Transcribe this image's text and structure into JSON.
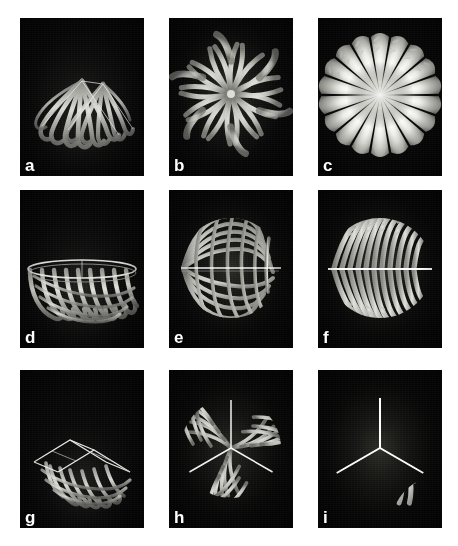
{
  "figure": {
    "background_color": "#ffffff",
    "panel_background_color": "#050505",
    "structure_color": "#d8d8d4",
    "label_color": "#ffffff",
    "grid": {
      "rows": 3,
      "columns": 3
    },
    "panels": [
      {
        "id": "a",
        "label": "a",
        "row": 1,
        "column": 1,
        "description": "fan-shaped ribbon bundle in oblique view, flattened shell",
        "structure": "oblique-fan",
        "ribbon_count": 14,
        "x": 20,
        "y": 18,
        "width": 124,
        "height": 158
      },
      {
        "id": "b",
        "label": "b",
        "row": 1,
        "column": 2,
        "description": "double counter-rotating spiral rosette seen from above",
        "structure": "spiral-rosette",
        "ribbon_count": 22,
        "x": 169,
        "y": 18,
        "width": 124,
        "height": 158
      },
      {
        "id": "c",
        "label": "c",
        "row": 1,
        "column": 3,
        "description": "bright radial burst with serrated blade tips",
        "structure": "radial-burst",
        "ribbon_count": 18,
        "x": 318,
        "y": 18,
        "width": 124,
        "height": 158
      },
      {
        "id": "d",
        "label": "d",
        "row": 2,
        "column": 1,
        "description": "bowl lattice with elliptical rim, oblique view",
        "structure": "oblique-bowl",
        "ribbon_count": 16,
        "x": 20,
        "y": 190,
        "width": 124,
        "height": 158
      },
      {
        "id": "e",
        "label": "e",
        "row": 2,
        "column": 2,
        "description": "woven orthogonal mesh over a disc with bright mid-axis",
        "structure": "woven-mesh",
        "ribbon_count": 20,
        "x": 169,
        "y": 190,
        "width": 124,
        "height": 158
      },
      {
        "id": "f",
        "label": "f",
        "row": 2,
        "column": 3,
        "description": "pinnate frond with bright horizontal rachis and serrated pinnae",
        "structure": "pinnate-frond",
        "ribbon_count": 22,
        "x": 318,
        "y": 190,
        "width": 124,
        "height": 158
      },
      {
        "id": "g",
        "label": "g",
        "row": 3,
        "column": 1,
        "description": "tent or saddle roof of curved ribs, oblique view",
        "structure": "oblique-tent",
        "ribbon_count": 12,
        "x": 20,
        "y": 370,
        "width": 124,
        "height": 158
      },
      {
        "id": "h",
        "label": "h",
        "row": 3,
        "column": 2,
        "description": "three-fold woven mesh with Y-shaped bright midribs",
        "structure": "trifold-mesh",
        "ribbon_count": 24,
        "x": 169,
        "y": 370,
        "width": 124,
        "height": 158
      },
      {
        "id": "i",
        "label": "i",
        "row": 3,
        "column": 3,
        "description": "three-fold palmate frond with serrated leaflets",
        "structure": "trifold-frond",
        "ribbon_count": 21,
        "x": 318,
        "y": 370,
        "width": 124,
        "height": 158
      }
    ]
  }
}
